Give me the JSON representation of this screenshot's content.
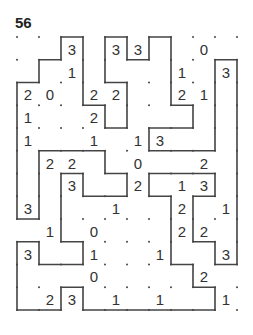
{
  "puzzle": {
    "title": "56",
    "type": "slitherlink",
    "cols": 10,
    "rows": 12,
    "clues": [
      [
        null,
        null,
        3,
        null,
        3,
        3,
        null,
        null,
        0,
        null
      ],
      [
        null,
        null,
        1,
        null,
        null,
        null,
        null,
        1,
        null,
        3
      ],
      [
        2,
        0,
        null,
        2,
        2,
        null,
        null,
        2,
        1,
        null
      ],
      [
        1,
        null,
        null,
        2,
        null,
        null,
        null,
        null,
        null,
        null
      ],
      [
        1,
        null,
        null,
        1,
        null,
        1,
        3,
        null,
        null,
        null
      ],
      [
        null,
        2,
        2,
        null,
        null,
        0,
        null,
        null,
        2,
        null
      ],
      [
        null,
        null,
        3,
        null,
        null,
        2,
        null,
        1,
        3,
        null
      ],
      [
        3,
        null,
        null,
        null,
        1,
        null,
        null,
        2,
        null,
        1
      ],
      [
        null,
        1,
        null,
        0,
        null,
        null,
        null,
        2,
        2,
        null
      ],
      [
        3,
        null,
        null,
        1,
        null,
        null,
        1,
        null,
        null,
        3
      ],
      [
        null,
        null,
        null,
        0,
        null,
        null,
        null,
        null,
        2,
        null
      ],
      [
        null,
        2,
        3,
        null,
        1,
        null,
        1,
        null,
        null,
        1
      ]
    ],
    "loop": [
      [
        0,
        2
      ],
      [
        1,
        2
      ],
      [
        1,
        1
      ],
      [
        2,
        1
      ],
      [
        2,
        0
      ],
      [
        3,
        0
      ],
      [
        3,
        3
      ],
      [
        4,
        3
      ],
      [
        4,
        4
      ],
      [
        5,
        4
      ],
      [
        5,
        2
      ],
      [
        4,
        2
      ],
      [
        4,
        0
      ],
      [
        5,
        0
      ],
      [
        5,
        1
      ],
      [
        6,
        1
      ],
      [
        6,
        0
      ],
      [
        7,
        0
      ],
      [
        7,
        3
      ],
      [
        8,
        3
      ],
      [
        8,
        4
      ],
      [
        6,
        4
      ],
      [
        6,
        5
      ],
      [
        9,
        5
      ],
      [
        9,
        1
      ],
      [
        10,
        1
      ],
      [
        10,
        10
      ],
      [
        9,
        10
      ],
      [
        9,
        9
      ],
      [
        8,
        9
      ],
      [
        8,
        7
      ],
      [
        9,
        7
      ],
      [
        9,
        6
      ],
      [
        6,
        6
      ],
      [
        6,
        7
      ],
      [
        7,
        7
      ],
      [
        7,
        10
      ],
      [
        8,
        10
      ],
      [
        8,
        11
      ],
      [
        9,
        11
      ],
      [
        9,
        12
      ],
      [
        3,
        12
      ],
      [
        3,
        11
      ],
      [
        2,
        11
      ],
      [
        2,
        12
      ],
      [
        0,
        12
      ],
      [
        0,
        9
      ],
      [
        1,
        9
      ],
      [
        1,
        10
      ],
      [
        3,
        10
      ],
      [
        3,
        9
      ],
      [
        2,
        9
      ],
      [
        2,
        6
      ],
      [
        3,
        6
      ],
      [
        3,
        7
      ],
      [
        5,
        7
      ],
      [
        5,
        6
      ],
      [
        4,
        6
      ],
      [
        4,
        5
      ],
      [
        1,
        5
      ],
      [
        1,
        8
      ],
      [
        0,
        8
      ]
    ],
    "colors": {
      "line": "#444444",
      "dot": "#444444",
      "text": "#333333"
    }
  }
}
